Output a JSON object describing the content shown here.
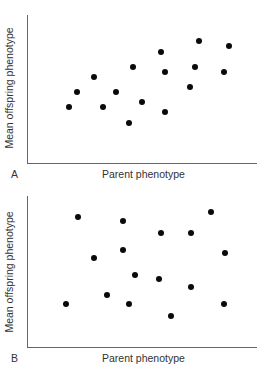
{
  "chart_data": [
    {
      "type": "scatter",
      "panel_label": "A",
      "title": "",
      "xlabel": "Parent phenotype",
      "ylabel": "Mean offspring phenotype",
      "grid": false,
      "legend": null,
      "ticks": "none",
      "note": "Positions in pixel space relative to plot area (x: 0=left axis, y: 0=bottom axis); no numeric tick labels shown. Shows positive correlation.",
      "points": [
        {
          "x": 42,
          "y": 56
        },
        {
          "x": 50,
          "y": 71
        },
        {
          "x": 67,
          "y": 86
        },
        {
          "x": 76,
          "y": 56
        },
        {
          "x": 89,
          "y": 71
        },
        {
          "x": 102,
          "y": 40
        },
        {
          "x": 106,
          "y": 96
        },
        {
          "x": 115,
          "y": 61
        },
        {
          "x": 134,
          "y": 111
        },
        {
          "x": 138,
          "y": 91
        },
        {
          "x": 138,
          "y": 51
        },
        {
          "x": 163,
          "y": 76
        },
        {
          "x": 168,
          "y": 96
        },
        {
          "x": 172,
          "y": 122
        },
        {
          "x": 197,
          "y": 91
        },
        {
          "x": 202,
          "y": 117
        }
      ]
    },
    {
      "type": "scatter",
      "panel_label": "B",
      "title": "",
      "xlabel": "Parent phenotype",
      "ylabel": "Mean offspring phenotype",
      "grid": false,
      "legend": null,
      "ticks": "none",
      "note": "Positions in pixel space relative to plot area (x: 0=left axis, y: 0=bottom axis); no numeric tick labels shown. Shows no correlation.",
      "points": [
        {
          "x": 51,
          "y": 130
        },
        {
          "x": 96,
          "y": 126
        },
        {
          "x": 134,
          "y": 114
        },
        {
          "x": 164,
          "y": 114
        },
        {
          "x": 184,
          "y": 135
        },
        {
          "x": 96,
          "y": 97
        },
        {
          "x": 67,
          "y": 89
        },
        {
          "x": 198,
          "y": 94
        },
        {
          "x": 108,
          "y": 72
        },
        {
          "x": 132,
          "y": 68
        },
        {
          "x": 164,
          "y": 60
        },
        {
          "x": 80,
          "y": 52
        },
        {
          "x": 39,
          "y": 43
        },
        {
          "x": 102,
          "y": 43
        },
        {
          "x": 197,
          "y": 43
        },
        {
          "x": 144,
          "y": 31
        }
      ]
    }
  ],
  "panels": [
    {
      "letter": "A",
      "xlabel": "Parent phenotype",
      "ylabel": "Mean offspring phenotype"
    },
    {
      "letter": "B",
      "xlabel": "Parent phenotype",
      "ylabel": "Mean offspring phenotype"
    }
  ],
  "colors": {
    "dot": "#0a0a0a",
    "axis": "#666666",
    "text": "#333333"
  }
}
